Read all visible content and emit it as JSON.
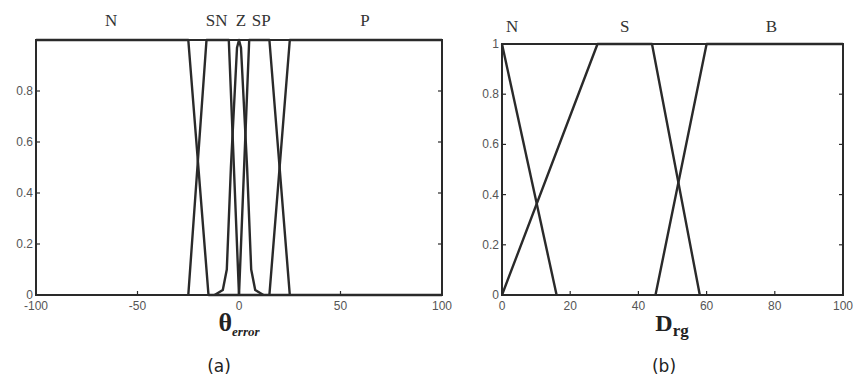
{
  "chart_data": [
    {
      "id": "a",
      "type": "line",
      "title": "",
      "caption": "(a)",
      "xlabel": "θ",
      "xlabel_subscript": "error",
      "ylabel": "",
      "xlim": [
        -100,
        100
      ],
      "ylim": [
        0,
        1
      ],
      "xticks": [
        -100,
        -50,
        0,
        50,
        100
      ],
      "yticks": [
        0,
        0.2,
        0.4,
        0.6,
        0.8
      ],
      "ytick_labels": [
        "0",
        "0.2",
        "0.4",
        "0.6",
        "0.8"
      ],
      "grid": false,
      "legend": "labels above curves",
      "series": [
        {
          "name": "N",
          "label_x": -63,
          "points": [
            [
              -100,
              1
            ],
            [
              -25,
              1
            ],
            [
              -15,
              0
            ],
            [
              100,
              0
            ]
          ]
        },
        {
          "name": "SN",
          "label_x": -11,
          "points": [
            [
              -25,
              0
            ],
            [
              -16,
              1
            ],
            [
              -5,
              1
            ],
            [
              0,
              0
            ]
          ]
        },
        {
          "name": "Z",
          "label_x": 1,
          "points": [
            [
              -12,
              0
            ],
            [
              -8,
              0.02
            ],
            [
              -6,
              0.1
            ],
            [
              -4,
              0.5
            ],
            [
              -1,
              0.97
            ],
            [
              0,
              1
            ],
            [
              1,
              0.97
            ],
            [
              4,
              0.5
            ],
            [
              6,
              0.1
            ],
            [
              8,
              0.02
            ],
            [
              12,
              0
            ]
          ]
        },
        {
          "name": "SP",
          "label_x": 11,
          "points": [
            [
              0,
              0
            ],
            [
              5,
              1
            ],
            [
              15,
              1
            ],
            [
              25,
              0
            ]
          ]
        },
        {
          "name": "P",
          "label_x": 62,
          "points": [
            [
              15,
              0
            ],
            [
              25,
              1
            ],
            [
              100,
              1
            ]
          ]
        }
      ]
    },
    {
      "id": "b",
      "type": "line",
      "title": "",
      "caption": "(b)",
      "xlabel": "D",
      "xlabel_subscript": "rg",
      "ylabel": "",
      "xlim": [
        0,
        100
      ],
      "ylim": [
        0,
        1
      ],
      "xticks": [
        0,
        20,
        40,
        60,
        80,
        100
      ],
      "yticks": [
        0,
        0.2,
        0.4,
        0.6,
        0.8,
        1
      ],
      "ytick_labels": [
        "0",
        "0.2",
        "0.4",
        "0.6",
        "0.8",
        "1"
      ],
      "grid": false,
      "legend": "labels above curves",
      "series": [
        {
          "name": "N",
          "label_x": 3,
          "points": [
            [
              0,
              1
            ],
            [
              16,
              0
            ]
          ]
        },
        {
          "name": "S",
          "label_x": 36,
          "points": [
            [
              0,
              0
            ],
            [
              28,
              1
            ],
            [
              44,
              1
            ],
            [
              58,
              0
            ]
          ]
        },
        {
          "name": "B",
          "label_x": 79,
          "points": [
            [
              45,
              0
            ],
            [
              60,
              1
            ],
            [
              100,
              1
            ]
          ]
        }
      ]
    }
  ],
  "figure": {
    "panel_a_caption": "(a)",
    "panel_b_caption": "(b)"
  }
}
